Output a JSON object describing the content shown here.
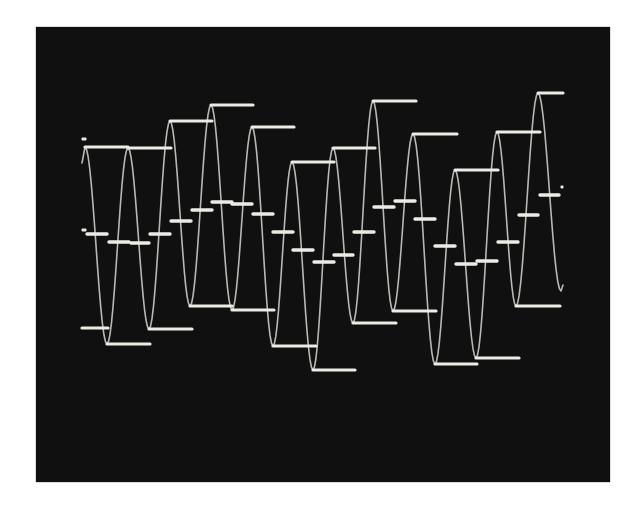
{
  "figure": {
    "colors": {
      "background": "#ffffff",
      "screen": "#101010",
      "trace": "#d6d6d0",
      "steps": "#ecece6"
    },
    "screen_rect": {
      "x": 36,
      "y": 27,
      "w": 574,
      "h": 455
    }
  },
  "chart_data": {
    "type": "line",
    "title": "",
    "xlabel": "",
    "ylabel": "",
    "grid": false,
    "legend": "none",
    "sine_extrema": [
      {
        "kind": "peak",
        "x": 85,
        "y": 147,
        "hold_to": 128
      },
      {
        "kind": "trough",
        "x": 107,
        "y": 344,
        "hold_to": 150
      },
      {
        "kind": "peak",
        "x": 128,
        "y": 148,
        "hold_to": 171
      },
      {
        "kind": "trough",
        "x": 149,
        "y": 329,
        "hold_to": 192
      },
      {
        "kind": "peak",
        "x": 170,
        "y": 121,
        "hold_to": 212
      },
      {
        "kind": "trough",
        "x": 190,
        "y": 306,
        "hold_to": 232
      },
      {
        "kind": "peak",
        "x": 211,
        "y": 105,
        "hold_to": 253
      },
      {
        "kind": "trough",
        "x": 232,
        "y": 310,
        "hold_to": 274
      },
      {
        "kind": "peak",
        "x": 252,
        "y": 127,
        "hold_to": 294
      },
      {
        "kind": "trough",
        "x": 273,
        "y": 346,
        "hold_to": 316
      },
      {
        "kind": "peak",
        "x": 292,
        "y": 162,
        "hold_to": 334
      },
      {
        "kind": "trough",
        "x": 313,
        "y": 370,
        "hold_to": 355
      },
      {
        "kind": "peak",
        "x": 333,
        "y": 148,
        "hold_to": 375
      },
      {
        "kind": "trough",
        "x": 353,
        "y": 323,
        "hold_to": 396
      },
      {
        "kind": "peak",
        "x": 373,
        "y": 101,
        "hold_to": 416
      },
      {
        "kind": "trough",
        "x": 393,
        "y": 311,
        "hold_to": 436
      },
      {
        "kind": "peak",
        "x": 413,
        "y": 134,
        "hold_to": 457
      },
      {
        "kind": "trough",
        "x": 435,
        "y": 364,
        "hold_to": 477
      },
      {
        "kind": "peak",
        "x": 455,
        "y": 170,
        "hold_to": 498
      },
      {
        "kind": "trough",
        "x": 476,
        "y": 358,
        "hold_to": 519
      },
      {
        "kind": "peak",
        "x": 497,
        "y": 132,
        "hold_to": 540
      },
      {
        "kind": "trough",
        "x": 516,
        "y": 306,
        "hold_to": 560
      },
      {
        "kind": "peak",
        "x": 538,
        "y": 93,
        "hold_to": 563
      }
    ],
    "trace_start": {
      "x": 82,
      "y": 163
    },
    "trace_end": {
      "x": 561,
      "y": 291
    },
    "lead_in_hold": {
      "x1": 82,
      "x2": 108,
      "y": 328
    },
    "mid_dashes": [
      {
        "x1": 86,
        "x2": 108,
        "y": 234
      },
      {
        "x1": 108,
        "x2": 130,
        "y": 242
      },
      {
        "x1": 130,
        "x2": 150,
        "y": 243
      },
      {
        "x1": 149,
        "x2": 171,
        "y": 234
      },
      {
        "x1": 170,
        "x2": 192,
        "y": 221
      },
      {
        "x1": 191,
        "x2": 213,
        "y": 210
      },
      {
        "x1": 211,
        "x2": 233,
        "y": 202
      },
      {
        "x1": 231,
        "x2": 253,
        "y": 204
      },
      {
        "x1": 252,
        "x2": 274,
        "y": 214
      },
      {
        "x1": 272,
        "x2": 294,
        "y": 232
      },
      {
        "x1": 292,
        "x2": 314,
        "y": 250
      },
      {
        "x1": 313,
        "x2": 335,
        "y": 262
      },
      {
        "x1": 333,
        "x2": 354,
        "y": 255
      },
      {
        "x1": 353,
        "x2": 375,
        "y": 232
      },
      {
        "x1": 373,
        "x2": 395,
        "y": 207
      },
      {
        "x1": 394,
        "x2": 416,
        "y": 201
      },
      {
        "x1": 414,
        "x2": 436,
        "y": 219
      },
      {
        "x1": 434,
        "x2": 456,
        "y": 246
      },
      {
        "x1": 455,
        "x2": 477,
        "y": 264
      },
      {
        "x1": 476,
        "x2": 498,
        "y": 261
      },
      {
        "x1": 497,
        "x2": 519,
        "y": 242
      },
      {
        "x1": 518,
        "x2": 539,
        "y": 215
      },
      {
        "x1": 539,
        "x2": 560,
        "y": 195
      }
    ],
    "markers": [
      {
        "x": 84,
        "y": 139,
        "w": 5,
        "h": 3
      },
      {
        "x": 84,
        "y": 230,
        "w": 5,
        "h": 3
      },
      {
        "x": 562,
        "y": 187,
        "w": 3,
        "h": 3
      }
    ]
  }
}
